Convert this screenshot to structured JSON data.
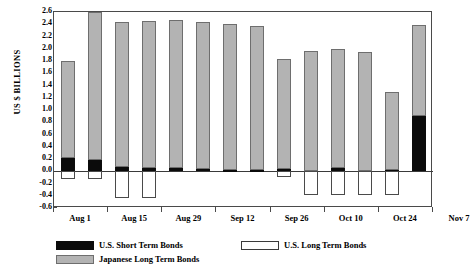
{
  "chart_data": {
    "type": "bar",
    "title": "",
    "xlabel": "",
    "ylabel": "US $ BILLIONS",
    "ylim": [
      -0.6,
      2.6
    ],
    "ystep": 0.2,
    "grid": false,
    "stacked": true,
    "legend_position": "bottom-left",
    "ytick_labels": [
      "2.6",
      "2.4",
      "2.2",
      "2.0",
      "1.8",
      "1.6",
      "1.4",
      "1.2",
      "1.0",
      "0.8",
      "0.6",
      "0.4",
      "0.2",
      "0.0",
      "-0.2",
      "-0.4",
      "-0.6"
    ],
    "ytick_values": [
      2.6,
      2.4,
      2.2,
      2.0,
      1.8,
      1.6,
      1.4,
      1.2,
      1.0,
      0.8,
      0.6,
      0.4,
      0.2,
      0.0,
      -0.2,
      -0.4,
      -0.6
    ],
    "xtick_labels": [
      "Aug 1",
      "Aug 15",
      "Aug 29",
      "Sep 12",
      "Sep 26",
      "Oct 10",
      "Oct 24",
      "Nov 7"
    ],
    "categories": [
      "1",
      "2",
      "3",
      "4",
      "5",
      "6",
      "7",
      "8",
      "9",
      "10",
      "11",
      "12",
      "13",
      "14"
    ],
    "series": [
      {
        "name": "U.S. Short Term Bonds",
        "color": "#0b0b0b",
        "values": [
          0.22,
          0.19,
          0.07,
          0.05,
          0.05,
          0.04,
          0.02,
          0.02,
          0.03,
          0.0,
          0.05,
          0.0,
          0.02,
          0.9
        ]
      },
      {
        "name": "U.S. Long Term Bonds",
        "color": "#ffffff",
        "values": [
          -0.12,
          -0.13,
          -0.44,
          -0.44,
          0.0,
          0.0,
          0.0,
          0.0,
          -0.1,
          -0.38,
          -0.38,
          -0.38,
          -0.38,
          0.0
        ]
      },
      {
        "name": "Japanese Long Term Bonds",
        "color": "#b3b3b3",
        "values": [
          1.58,
          2.41,
          2.37,
          2.41,
          2.42,
          2.4,
          2.39,
          2.35,
          1.81,
          1.97,
          1.95,
          1.95,
          1.28,
          1.49
        ]
      }
    ]
  },
  "legend": {
    "items": [
      {
        "label": "U.S. Short Term Bonds",
        "swatch": "short-term-swatch"
      },
      {
        "label": "U.S. Long Term Bonds",
        "swatch": "long-term-swatch"
      },
      {
        "label": "Japanese Long Term Bonds",
        "swatch": "japanese-long-term-swatch"
      }
    ]
  }
}
